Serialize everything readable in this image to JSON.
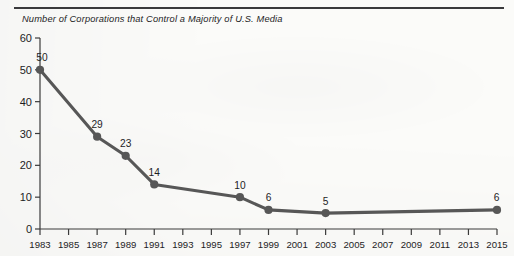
{
  "page": {
    "rule_color": "#3a3a3c",
    "background": "#fbfbf9"
  },
  "chart_data": {
    "type": "line",
    "title": "Number of Corporations that Control a Majority of U.S. Media",
    "xlabel": "",
    "ylabel": "",
    "x": [
      1983,
      1987,
      1989,
      1991,
      1997,
      1999,
      2003,
      2015
    ],
    "values": [
      50,
      29,
      23,
      14,
      10,
      6,
      5,
      6
    ],
    "point_labels": [
      "50",
      "29",
      "23",
      "14",
      "10",
      "6",
      "5",
      "6"
    ],
    "xlim": [
      1983,
      2015
    ],
    "ylim": [
      0,
      60
    ],
    "yticks": [
      0,
      10,
      20,
      30,
      40,
      50,
      60
    ],
    "ytick_labels": [
      "0",
      "10",
      "20",
      "30",
      "40",
      "50",
      "60"
    ],
    "xticks": [
      1983,
      1985,
      1987,
      1989,
      1991,
      1993,
      1995,
      1997,
      1999,
      2001,
      2003,
      2005,
      2007,
      2009,
      2011,
      2013,
      2015
    ],
    "xtick_labels": [
      "1983",
      "1985",
      "1987",
      "1989",
      "1991",
      "1993",
      "1995",
      "1997",
      "1999",
      "2001",
      "2003",
      "2005",
      "2007",
      "2009",
      "2011",
      "2013",
      "2015"
    ],
    "grid": false,
    "legend": false,
    "series_color": "#575757",
    "marker": "circle",
    "axis_color": "#3b3b3b"
  }
}
